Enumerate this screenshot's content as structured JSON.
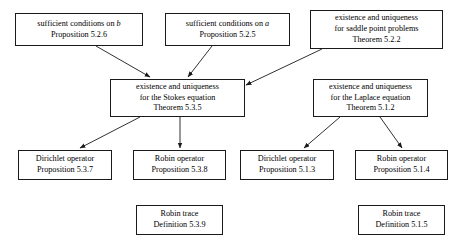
{
  "diagram": {
    "type": "flowchart",
    "background_color": "#ffffff",
    "border_color": "#1a1a1a",
    "text_color": "#000000",
    "nodes": [
      {
        "id": "suff-b",
        "line1": "sufficient conditions on b",
        "line1_italic_tail": "b",
        "line2": "Proposition 5.2.6",
        "x": 15,
        "y": 13,
        "w": 128,
        "h": 33
      },
      {
        "id": "suff-a",
        "line1": "sufficient conditions on a",
        "line1_italic_tail": "a",
        "line2": "Proposition 5.2.5",
        "x": 165,
        "y": 13,
        "w": 125,
        "h": 33
      },
      {
        "id": "saddle-point",
        "line1": "existence and uniqueness",
        "line2": "for saddle point problems",
        "line3": "Theorem 5.2.2",
        "x": 310,
        "y": 10,
        "w": 133,
        "h": 39
      },
      {
        "id": "stokes",
        "line1": "existence and uniqueness",
        "line2": "for the Stokes equation",
        "line3": "Theorem 5.3.5",
        "x": 110,
        "y": 79,
        "w": 135,
        "h": 38
      },
      {
        "id": "laplace",
        "line1": "existence and uniqueness",
        "line2": "for the Laplace equation",
        "line3": "Theorem 5.1.2",
        "x": 313,
        "y": 79,
        "w": 115,
        "h": 38
      },
      {
        "id": "dirichlet-537",
        "line1": "Dirichlet operator",
        "line2": "Proposition 5.3.7",
        "x": 18,
        "y": 150,
        "w": 94,
        "h": 30
      },
      {
        "id": "robin-538",
        "line1": "Robin operator",
        "line2": "Proposition 5.3.8",
        "x": 133,
        "y": 150,
        "w": 93,
        "h": 30
      },
      {
        "id": "dirichlet-513",
        "line1": "Dirichlet operator",
        "line2": "Proposition 5.1.3",
        "x": 240,
        "y": 150,
        "w": 94,
        "h": 30
      },
      {
        "id": "robin-514",
        "line1": "Robin operator",
        "line2": "Proposition 5.1.4",
        "x": 355,
        "y": 150,
        "w": 93,
        "h": 30
      },
      {
        "id": "robin-trace-539",
        "line1": "Robin trace",
        "line2": "Definition 5.3.9",
        "x": 136,
        "y": 205,
        "w": 87,
        "h": 30
      },
      {
        "id": "robin-trace-515",
        "line1": "Robin trace",
        "line2": "Definition 5.1.5",
        "x": 358,
        "y": 205,
        "w": 87,
        "h": 30
      }
    ],
    "edges": [
      {
        "id": "edge-suff-b-to-stokes",
        "from": "suff-b",
        "to": "stokes",
        "x1": 96,
        "y1": 46,
        "x2": 150,
        "y2": 77
      },
      {
        "id": "edge-suff-a-to-stokes",
        "from": "suff-a",
        "to": "stokes",
        "x1": 212,
        "y1": 46,
        "x2": 188,
        "y2": 77
      },
      {
        "id": "edge-saddle-to-stokes",
        "from": "saddle-point",
        "to": "stokes",
        "x1": 322,
        "y1": 49,
        "x2": 246,
        "y2": 85
      },
      {
        "id": "edge-stokes-to-dirichlet537",
        "from": "stokes",
        "to": "dirichlet-537",
        "x1": 140,
        "y1": 117,
        "x2": 80,
        "y2": 148
      },
      {
        "id": "edge-stokes-to-robin538",
        "from": "stokes",
        "to": "robin-538",
        "x1": 180,
        "y1": 117,
        "x2": 180,
        "y2": 148
      },
      {
        "id": "edge-laplace-to-dirichlet513",
        "from": "laplace",
        "to": "dirichlet-513",
        "x1": 340,
        "y1": 117,
        "x2": 304,
        "y2": 148
      },
      {
        "id": "edge-laplace-to-robin514",
        "from": "laplace",
        "to": "robin-514",
        "x1": 380,
        "y1": 117,
        "x2": 402,
        "y2": 148
      }
    ]
  }
}
